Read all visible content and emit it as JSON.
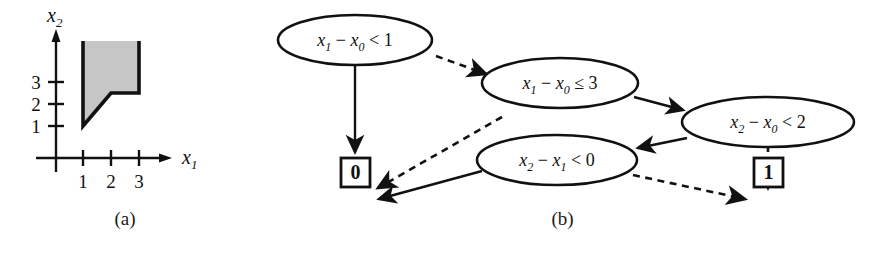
{
  "figure": {
    "panel_a": {
      "caption": "(a)",
      "xaxis": {
        "label_var": "x",
        "label_sub": "1",
        "ticks": [
          "1",
          "2",
          "3"
        ]
      },
      "yaxis": {
        "label_var": "x",
        "label_sub": "2",
        "ticks": [
          "1",
          "2",
          "3"
        ]
      },
      "region": {
        "fill_color": "#c6c6c6",
        "edge_color": "#111111",
        "vertices": [
          [
            1,
            1
          ],
          [
            1,
            4.1
          ],
          [
            3,
            4.1
          ],
          [
            3,
            2
          ],
          [
            2,
            2
          ]
        ]
      }
    },
    "panel_b": {
      "caption": "(b)",
      "nodes": [
        {
          "id": "n1",
          "shape": "ellipse",
          "lhs_var": "x",
          "lhs_sub": "1",
          "minus": "−",
          "rhs_var": "x",
          "rhs_sub": "0",
          "op": "<",
          "bound": "1"
        },
        {
          "id": "n2",
          "shape": "ellipse",
          "lhs_var": "x",
          "lhs_sub": "1",
          "minus": "−",
          "rhs_var": "x",
          "rhs_sub": "0",
          "op": "≤",
          "bound": "3"
        },
        {
          "id": "n3",
          "shape": "ellipse",
          "lhs_var": "x",
          "lhs_sub": "2",
          "minus": "−",
          "rhs_var": "x",
          "rhs_sub": "0",
          "op": "<",
          "bound": "2"
        },
        {
          "id": "n4",
          "shape": "ellipse",
          "lhs_var": "x",
          "lhs_sub": "2",
          "minus": "−",
          "rhs_var": "x",
          "rhs_sub": "1",
          "op": "<",
          "bound": "0"
        }
      ],
      "terminals": [
        {
          "id": "t0",
          "label": "0"
        },
        {
          "id": "t1",
          "label": "1"
        }
      ],
      "edges": [
        {
          "from": "n1",
          "to": "t0",
          "style": "solid"
        },
        {
          "from": "n1",
          "to": "n2",
          "style": "dashed"
        },
        {
          "from": "n2",
          "to": "n3",
          "style": "solid"
        },
        {
          "from": "n2",
          "to": "t0",
          "style": "dashed"
        },
        {
          "from": "n3",
          "to": "n4",
          "style": "solid"
        },
        {
          "from": "n3",
          "to": "t1",
          "style": "dashed"
        },
        {
          "from": "n4",
          "to": "t0",
          "style": "solid"
        },
        {
          "from": "n4",
          "to": "t1",
          "style": "dashed"
        }
      ]
    }
  }
}
